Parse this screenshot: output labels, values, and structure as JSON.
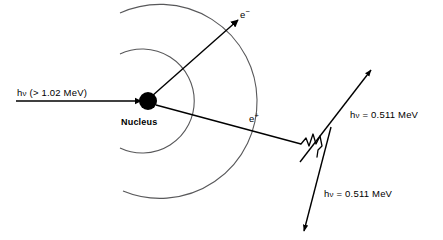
{
  "figure": {
    "background_color": "#ffffff",
    "stroke_color": "#000000",
    "arc_color": "#58585a",
    "width": 443,
    "height": 240
  },
  "labels": {
    "incident_photon": "hν (> 1.02 MeV)",
    "incident_photon_prefix": "h",
    "incident_photon_symbol": "ν",
    "incident_photon_suffix": " (> 1.02 MeV)",
    "nucleus": "Nucleus",
    "electron": "e",
    "electron_charge": "−",
    "positron": "e",
    "positron_charge": "+",
    "annihilation_photon_1": "hν = 0.511 MeV",
    "annihilation_photon_2": "hν = 0.511 MeV",
    "annihilation_photon_prefix": "h",
    "annihilation_photon_symbol": "ν",
    "annihilation_photon_suffix": " = 0.511 MeV"
  },
  "physics": {
    "incident_energy_threshold_mev": 1.02,
    "annihilation_photon_energy_mev": 0.511,
    "annihilation_photon_count": 2,
    "particles_created": [
      "electron",
      "positron"
    ],
    "interaction": "pair production"
  },
  "geometry": {
    "nucleus": {
      "cx": 148,
      "cy": 101,
      "r": 9
    },
    "incident_ray": {
      "x1": 16,
      "y1": 101,
      "x2": 140,
      "y2": 101
    },
    "electron_track": {
      "x1": 152,
      "y1": 97,
      "x2": 237,
      "y2": 20
    },
    "positron_track": {
      "x1": 155,
      "y1": 104,
      "x2": 300,
      "y2": 143
    },
    "field_arc_inner_radius": 52,
    "field_arc_outer_radius": 97,
    "annihilation_point": {
      "x": 312,
      "y": 146
    },
    "photon_up_arrow": {
      "x1": 302,
      "y1": 160,
      "x2": 372,
      "y2": 70
    },
    "photon_down_arrow": {
      "x1": 330,
      "y1": 128,
      "x2": 304,
      "y2": 230
    }
  },
  "label_positions": {
    "incident_photon": {
      "left": 17,
      "top": 88
    },
    "nucleus": {
      "left": 121,
      "top": 118
    },
    "electron": {
      "left": 240,
      "top": 8
    },
    "positron": {
      "left": 249,
      "top": 112
    },
    "annihilation_photon_1": {
      "left": 350,
      "top": 110
    },
    "annihilation_photon_2": {
      "left": 324,
      "top": 189
    }
  }
}
